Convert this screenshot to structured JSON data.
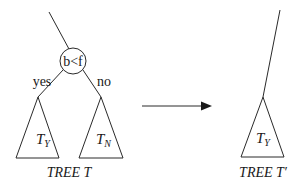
{
  "diagram": {
    "tree_t": {
      "caption": "TREE T",
      "node": {
        "label": "b<f"
      },
      "branches": {
        "left_label": "yes",
        "right_label": "no"
      },
      "subtrees": [
        {
          "main": "T",
          "sub": "Y"
        },
        {
          "main": "T",
          "sub": "N"
        }
      ]
    },
    "arrow": {
      "direction": "right"
    },
    "tree_t_prime": {
      "caption": "TREE T′",
      "subtree": {
        "main": "T",
        "sub": "Y"
      }
    },
    "colors": {
      "line": "#2a2a2a",
      "text": "#1a1a1a",
      "background": "#ffffff"
    }
  }
}
